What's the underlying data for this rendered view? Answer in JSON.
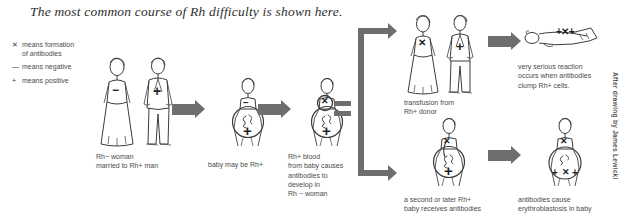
{
  "title": "The most common course of Rh difficulty is shown here.",
  "legend": {
    "items": [
      {
        "symbol": "✕",
        "text": "means formation",
        "continuation": "of antibodies"
      },
      {
        "symbol": "—",
        "text": "means negative",
        "continuation": ""
      },
      {
        "symbol": "+",
        "text": "means positive",
        "continuation": ""
      }
    ]
  },
  "figures": {
    "couple": {
      "caption": "Rh−  woman\nmarried to Rh+ man",
      "woman_badge": "−",
      "man_badge": "+"
    },
    "pregnant_first": {
      "caption": "baby may be Rh+",
      "mother_badge": "−",
      "baby_badge": "+"
    },
    "pregnant_antibodies": {
      "caption": "Rh+ blood\nfrom baby causes\nantibodies to\ndevelop in\nRh −  woman",
      "mother_badge": "✕",
      "baby_badge": "+"
    },
    "transfusion": {
      "caption": "transfusion from\nRh+ donor",
      "woman_badge": "✕",
      "man_badge": "+"
    },
    "reaction": {
      "caption": "very serious reaction\noccurs when antibodies\nclump Rh+ cells.",
      "marks": "+✕+"
    },
    "second_baby": {
      "caption": "a second or later Rh+\nbaby receives antibodies",
      "mother_badge": "✕",
      "baby_badge": "+"
    },
    "erythroblastosis": {
      "caption": "antibodies cause\nerythroblastosis in baby",
      "mother_badge": "✕",
      "baby_marks_left": "+",
      "baby_marks_center": "✕",
      "baby_marks_right": "+"
    }
  },
  "connectors": {
    "equals_label": "=",
    "arrow_label": "arrow"
  },
  "credit": "After drawing by James Lewicki",
  "colors": {
    "arrow": "#6e6e6e",
    "ink": "#3a3a3a",
    "caption": "#4a4a4a",
    "background": "#ffffff"
  }
}
